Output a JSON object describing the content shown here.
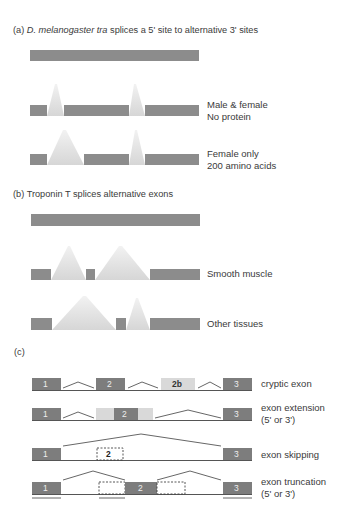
{
  "panel_a": {
    "label": "(a)",
    "title_italic": "D. melanogaster tra",
    "title_rest": " splices a 5' site to alternative 3' sites",
    "rows": [
      {
        "line1": "Male & female",
        "line2": "No protein"
      },
      {
        "line1": "Female only",
        "line2": "200 amino acids"
      }
    ]
  },
  "panel_b": {
    "label": "(b)",
    "title": "Troponin T splices alternative exons",
    "rows": [
      {
        "line1": "Smooth muscle"
      },
      {
        "line1": "Other tissues"
      }
    ]
  },
  "panel_c": {
    "label": "(c)",
    "rows": [
      {
        "line1": "cryptic exon",
        "exons": [
          "1",
          "2",
          "2b",
          "3"
        ]
      },
      {
        "line1": "exon extension",
        "line2": "(5' or 3')",
        "exons": [
          "1",
          "2",
          "3"
        ]
      },
      {
        "line1": "exon skipping",
        "exons": [
          "1",
          "2",
          "3"
        ]
      },
      {
        "line1": "exon truncation",
        "line2": "(5' or 3')",
        "exons": [
          "1",
          "2",
          "3"
        ]
      }
    ]
  },
  "colors": {
    "exon": "#8c8c8c",
    "exon_dark": "#7d7d7d",
    "exon_light": "#d9d9d9",
    "splice_wedge": "#e2e2e2",
    "line": "#555555",
    "text": "#3a3a3a"
  }
}
